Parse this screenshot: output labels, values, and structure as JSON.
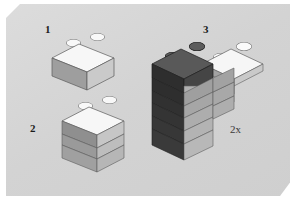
{
  "diagram": {
    "type": "lego-assembly-instruction",
    "background_color": "#d5d5d5",
    "page_color": "#ffffff"
  },
  "steps": [
    {
      "id": "step-1",
      "label": "1",
      "piece": "1x2 brick",
      "color_name": "white",
      "color": "#f2f2f2",
      "studs": 2,
      "layers": 1
    },
    {
      "id": "step-2",
      "label": "2",
      "piece": "1x2 brick stack",
      "color_name": "white",
      "color": "#f2f2f2",
      "studs": 2,
      "layers": 3
    },
    {
      "id": "step-3",
      "label": "3",
      "piece": "1x2 dark brick with 1x4 white plate",
      "color_name": "dark gray / white",
      "color": "#4a4a4a",
      "plate_color": "#f4f4f4",
      "studs": 4,
      "layers": 5
    }
  ],
  "annotations": {
    "quantity": "2x"
  },
  "palette": {
    "white_top": "#fafafa",
    "white_front": "#c9c9c9",
    "white_side": "#9d9d9d",
    "dark_top": "#585858",
    "dark_front": "#3d3d3d",
    "dark_side": "#2c2c2c",
    "mid_front": "#b4b4b4",
    "mid_side": "#8b8b8b",
    "stud_cap": "#f6f6f6",
    "stud_cap_dark": "#5e5e5e",
    "outline": "#3c3c3c",
    "label_color": "#1b1b1b"
  }
}
